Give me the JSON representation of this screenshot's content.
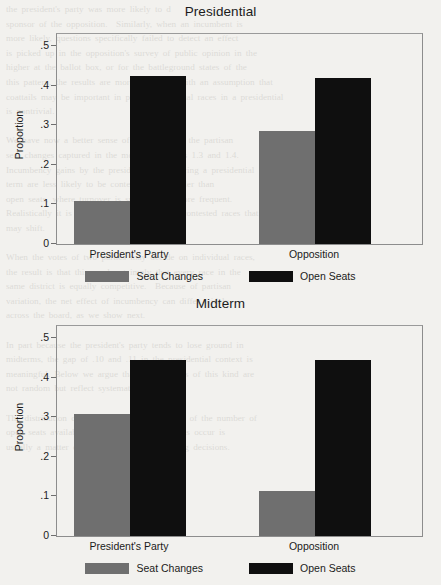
{
  "background_text": "the president's party was more likely to d\nsponsor of the opposition.  Similarly, when an incumbent is\nmore likely, questions specifically failed to detect an effect\nis picked up in the opposition's survey of public opinion in the\nhigher at the ballot box, or for the battleground states of the\nthis pattern, the results are more consistent with an assumption that\ncoattails may be important in part of individual races in a presidential\nis nontrivial.\n\nWe have now a better sense of the nature of the partisan\nseat changes captured in the models in Tables 1.3 and 1.4.\nIncumbency gains by the president's party during a presidential\nterm are less likely to be contested and smaller than\nopen seats, where turnover is substantially more frequent.\nRealistically it is the size of the share of uncontested races that\nmay shift.\n\nWhen the votes of two parties may decide on individual races,\nthe result is that this need not imply that every race in the\nsame district is equally competitive.  Because of partisan\nvariation, the net effect of incumbency can differ widely\nacross the board, as we show next.\n\nIn part because the president's party tends to lose ground in\nmidterms, the gap of .10 and .11 in the presidential context is\nmeaningful. Below we argue that seat changes of this kind are\nnot random but reflect systematic forces.\n\nThe distribution of seat changes is a function of the number of\nopen seats available, and where the open seats occur is\nusually a matter of retirement and redistricting decisions.",
  "colors": {
    "seat_changes": "#6f6f6f",
    "open_seats": "#0f0f0f",
    "axis": "#8d8d8d",
    "text": "#1b1b1b",
    "page_background": "#f2f1ee"
  },
  "chart_data": [
    {
      "type": "bar",
      "title": "Presidential",
      "xlabel": "",
      "ylabel": "Proportion",
      "categories": [
        "President's Party",
        "Opposition"
      ],
      "ylim": [
        0,
        0.53
      ],
      "yticks": [
        "0",
        ".1",
        ".2",
        ".3",
        ".4",
        ".5"
      ],
      "ytick_values": [
        0,
        0.1,
        0.2,
        0.3,
        0.4,
        0.5
      ],
      "grid": false,
      "legend_position": "bottom",
      "series": [
        {
          "name": "Seat Changes",
          "color": "#6f6f6f",
          "values": [
            0.108,
            0.285
          ]
        },
        {
          "name": "Open Seats",
          "color": "#0f0f0f",
          "values": [
            0.425,
            0.42
          ]
        }
      ]
    },
    {
      "type": "bar",
      "title": "Midterm",
      "xlabel": "",
      "ylabel": "Proportion",
      "categories": [
        "President's Party",
        "Opposition"
      ],
      "ylim": [
        0,
        0.53
      ],
      "yticks": [
        "0",
        ".1",
        ".2",
        ".3",
        ".4",
        ".5"
      ],
      "ytick_values": [
        0,
        0.1,
        0.2,
        0.3,
        0.4,
        0.5
      ],
      "grid": false,
      "legend_position": "bottom",
      "series": [
        {
          "name": "Seat Changes",
          "color": "#6f6f6f",
          "values": [
            0.307,
            0.113
          ]
        },
        {
          "name": "Open Seats",
          "color": "#0f0f0f",
          "values": [
            0.445,
            0.445
          ]
        }
      ]
    }
  ]
}
